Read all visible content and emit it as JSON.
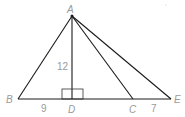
{
  "diagram": {
    "type": "geometry-triangle",
    "points": {
      "A": {
        "label": "A",
        "x": 72,
        "y": 16
      },
      "B": {
        "label": "B",
        "x": 18,
        "y": 99
      },
      "D": {
        "label": "D",
        "x": 72,
        "y": 99
      },
      "C": {
        "label": "C",
        "x": 133,
        "y": 99
      },
      "E": {
        "label": "E",
        "x": 171,
        "y": 99
      }
    },
    "segments": [
      {
        "from": "A",
        "to": "B"
      },
      {
        "from": "A",
        "to": "D"
      },
      {
        "from": "A",
        "to": "C"
      },
      {
        "from": "A",
        "to": "E"
      },
      {
        "from": "B",
        "to": "E"
      }
    ],
    "measurements": {
      "AD": "12",
      "BD": "9",
      "CE": "7"
    },
    "right_angle_at": "D",
    "colors": {
      "line": "#1a1a1a",
      "label": "#9a9a9a"
    }
  }
}
